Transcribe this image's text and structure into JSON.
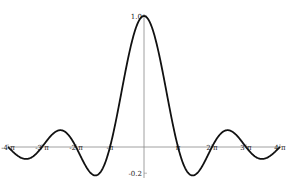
{
  "chart_data": {
    "type": "line",
    "title": "",
    "xlabel": "",
    "ylabel": "",
    "function": "sin(x)/x",
    "xlim": [
      -12.566,
      12.566
    ],
    "ylim": [
      -0.22,
      1.0
    ],
    "grid": false,
    "legend": null,
    "x_ticks": [
      {
        "value": -12.566,
        "label": "-4 π"
      },
      {
        "value": -9.425,
        "label": "-3 π"
      },
      {
        "value": -6.283,
        "label": "-2 π"
      },
      {
        "value": -3.1416,
        "label": "-π"
      },
      {
        "value": 3.1416,
        "label": "π"
      },
      {
        "value": 6.283,
        "label": "2 π"
      },
      {
        "value": 9.425,
        "label": "3 π"
      },
      {
        "value": 12.566,
        "label": "4 π"
      }
    ],
    "y_ticks": [
      {
        "value": 1.0,
        "label": "1.0"
      },
      {
        "value": -0.2,
        "label": "-0.2"
      }
    ],
    "series": [
      {
        "name": "sin(x)/x",
        "x": [
          -12.566,
          -11.0,
          -10.0,
          -9.425,
          -8.0,
          -7.725,
          -7.0,
          -6.283,
          -5.0,
          -4.493,
          -4.0,
          -3.1416,
          -2.0,
          -1.0,
          0,
          1.0,
          2.0,
          3.1416,
          4.0,
          4.493,
          5.0,
          6.283,
          7.0,
          7.725,
          8.0,
          9.425,
          10.0,
          11.0,
          12.566
        ],
        "y": [
          0.0,
          -0.091,
          -0.054,
          0.0,
          0.124,
          0.128,
          0.094,
          0.0,
          -0.192,
          -0.217,
          -0.189,
          0.0,
          0.455,
          0.841,
          1.0,
          0.841,
          0.455,
          0.0,
          -0.189,
          -0.217,
          -0.192,
          0.0,
          0.094,
          0.128,
          0.124,
          0.0,
          -0.054,
          -0.091,
          0.0
        ]
      }
    ]
  },
  "axes": {
    "x_tick_labels": [
      "-4 π",
      "-3 π",
      "-2 π",
      "-π",
      "π",
      "2 π",
      "3 π",
      "4 π"
    ],
    "y_tick_labels": [
      "1.0",
      "-0.2"
    ]
  }
}
